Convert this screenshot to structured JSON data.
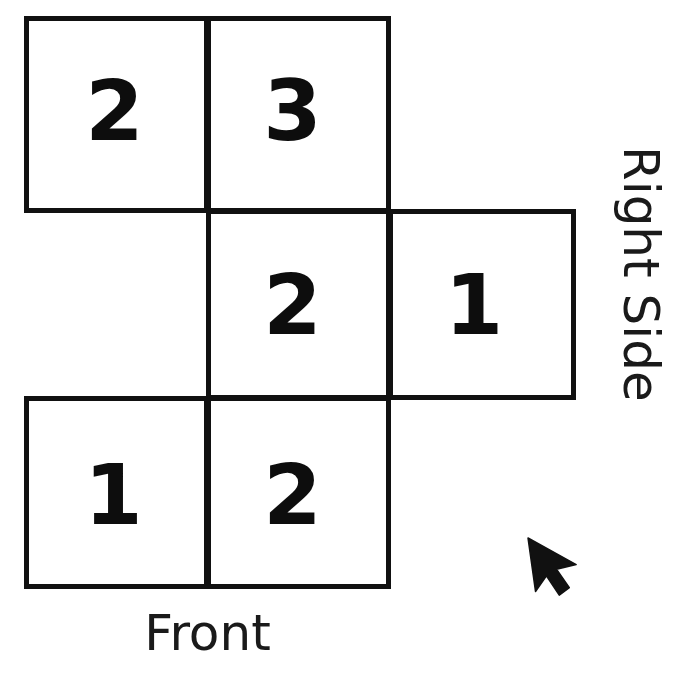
{
  "diagram": {
    "title_alt": "Cube net with numbered faces",
    "ink_color": "#111111",
    "background_color": "#ffffff",
    "cells": [
      {
        "id": "top-left",
        "digit": "2",
        "row": 1,
        "col": 1
      },
      {
        "id": "top-middle",
        "digit": "3",
        "row": 1,
        "col": 2
      },
      {
        "id": "middle",
        "digit": "2",
        "row": 2,
        "col": 2
      },
      {
        "id": "right",
        "digit": "1",
        "row": 2,
        "col": 3
      },
      {
        "id": "bottom-left",
        "digit": "1",
        "row": 3,
        "col": 1
      },
      {
        "id": "bottom-middle",
        "digit": "2",
        "row": 3,
        "col": 2
      }
    ]
  },
  "labels": {
    "front": "Front",
    "right_side": "Right Side"
  },
  "cursor": {
    "icon": "arrow-pointer-icon",
    "x": 528,
    "y": 540
  }
}
